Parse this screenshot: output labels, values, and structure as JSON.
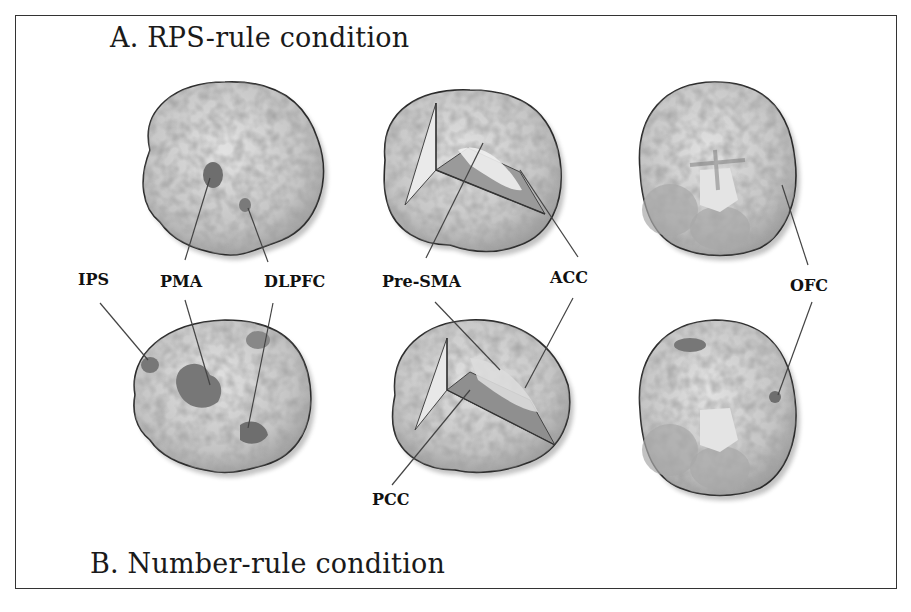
{
  "figure": {
    "panel_a_title": "A. RPS-rule condition",
    "panel_b_title": "B. Number-rule condition",
    "views": [
      "lateral",
      "medial-cutaway",
      "ventral"
    ],
    "labels": {
      "ips": "IPS",
      "pma": "PMA",
      "dlpfc": "DLPFC",
      "pre_sma": "Pre-SMA",
      "acc": "ACC",
      "ofc": "OFC",
      "pcc": "PCC"
    },
    "colors": {
      "brain_fill": "#c9c9c9",
      "activation": "#7a7a7a",
      "outline": "#2a2a2a",
      "leader_line": "#444444"
    }
  }
}
